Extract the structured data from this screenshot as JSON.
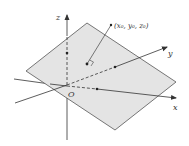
{
  "diagram": {
    "title": "",
    "colors": {
      "plane_fill": "#e4e4e4",
      "plane_stroke": "#555555",
      "axis": "#333333",
      "background": "#ffffff"
    },
    "labels": {
      "z_axis": "z",
      "y_axis": "y",
      "x_axis": "x",
      "origin": "O",
      "point": "(x₀, y₀, z₀)"
    },
    "elements": {
      "plane": "shaded parallelogram plane",
      "point_marker": "point on plane with right-angle (normal) indicator",
      "leader_line": "line from point to coordinate label"
    }
  }
}
